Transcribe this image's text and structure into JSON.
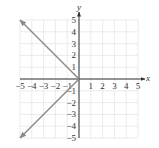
{
  "chart_data": {
    "type": "line",
    "title": "",
    "xlabel": "x",
    "ylabel": "y",
    "xlim": [
      -5,
      5
    ],
    "ylim": [
      -5,
      5
    ],
    "grid": true,
    "x_ticks": [
      -5,
      -4,
      -3,
      -2,
      -1,
      1,
      2,
      3,
      4,
      5
    ],
    "y_ticks": [
      -5,
      -4,
      -3,
      -2,
      -1,
      1,
      2,
      3,
      4,
      5
    ],
    "x_tick_labels": [
      "−5",
      "−4",
      "−3",
      "−2",
      "−1",
      "1",
      "2",
      "3",
      "4",
      "5"
    ],
    "y_tick_labels": [
      "−5",
      "−4",
      "−3",
      "−2",
      "−1",
      "1",
      "2",
      "3",
      "4",
      "5"
    ],
    "series": [
      {
        "name": "upper ray",
        "x": [
          0,
          -5
        ],
        "y": [
          0,
          5
        ],
        "arrow_end": true
      },
      {
        "name": "lower ray",
        "x": [
          0,
          -5
        ],
        "y": [
          0,
          -5
        ],
        "arrow_end": true
      }
    ],
    "colors": {
      "grid": "#e6e6e6",
      "axis": "#333333",
      "line": "#8a8a8a"
    }
  }
}
